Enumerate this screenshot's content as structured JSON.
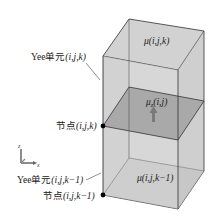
{
  "diagram": {
    "type": "yee-cell-stack",
    "labels": {
      "mu_top": "μ(i,j,k)",
      "mu_z": "μ",
      "mu_z_sub": "z",
      "mu_z_args": "(i,j)",
      "mu_bottom": "μ(i,j,k−1)",
      "yee_top_prefix": "Yee单元",
      "yee_top_args": "(i,j,k)",
      "node_top_prefix": "节点",
      "node_top_args": "(i,j,k)",
      "yee_bottom_prefix": "Yee单元",
      "yee_bottom_args": "(i,j,k−1)",
      "node_bottom_prefix": "节点",
      "node_bottom_args": "(i,j,k−1)",
      "axis_z": "z",
      "axis_x": "x"
    },
    "colors": {
      "box_fill": "#d4d4d4",
      "box_fill_front": "#cacaca",
      "plane_fill": "#a8a8a8",
      "edge": "#333333",
      "arrow": "#7a7a7a",
      "node": "#000000"
    }
  }
}
